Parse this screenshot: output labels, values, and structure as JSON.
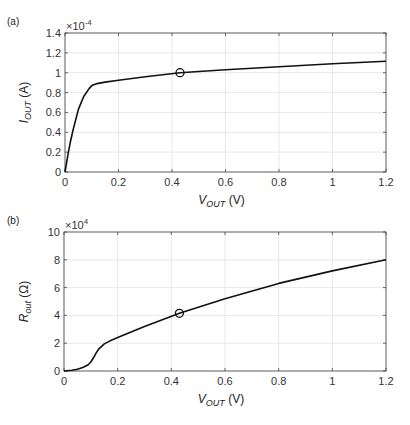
{
  "chart_data": [
    {
      "type": "line",
      "panel_label": "(a)",
      "title": "",
      "xlabel": "V_OUT (V)",
      "xlabel_main": "V",
      "xlabel_sub": "OUT",
      "xlabel_unit": "(V)",
      "ylabel": "I_OUT (A)",
      "ylabel_main": "I",
      "ylabel_sub": "OUT",
      "ylabel_unit": "(A)",
      "exponent_label": "×10",
      "exponent": "-4",
      "xlim": [
        0,
        1.2
      ],
      "ylim": [
        0,
        1.4
      ],
      "x_ticks": [
        "0",
        "0.2",
        "0.4",
        "0.6",
        "0.8",
        "1",
        "1.2"
      ],
      "y_ticks": [
        "0",
        "0.2",
        "0.4",
        "0.6",
        "0.8",
        "1",
        "1.2",
        "1.4"
      ],
      "grid": true,
      "series": [
        {
          "name": "I_OUT",
          "x": [
            0,
            0.01,
            0.02,
            0.03,
            0.05,
            0.07,
            0.09,
            0.1,
            0.12,
            0.15,
            0.2,
            0.3,
            0.43,
            0.6,
            0.8,
            1.0,
            1.2
          ],
          "values": [
            0,
            0.16,
            0.3,
            0.42,
            0.63,
            0.76,
            0.84,
            0.87,
            0.89,
            0.905,
            0.925,
            0.96,
            1.0,
            1.03,
            1.06,
            1.09,
            1.115
          ]
        }
      ],
      "marker": {
        "x": 0.43,
        "y": 1.0,
        "shape": "circle"
      }
    },
    {
      "type": "line",
      "panel_label": "(b)",
      "title": "",
      "xlabel": "V_OUT (V)",
      "xlabel_main": "V",
      "xlabel_sub": "OUT",
      "xlabel_unit": "(V)",
      "ylabel": "R_out (Ω)",
      "ylabel_main": "R",
      "ylabel_sub": "out",
      "ylabel_unit": "(Ω)",
      "exponent_label": "×10",
      "exponent": "4",
      "xlim": [
        0,
        1.2
      ],
      "ylim": [
        0,
        10
      ],
      "x_ticks": [
        "0",
        "0.2",
        "0.4",
        "0.6",
        "0.8",
        "1",
        "1.2"
      ],
      "y_ticks": [
        "0",
        "2",
        "4",
        "6",
        "8",
        "10"
      ],
      "grid": true,
      "series": [
        {
          "name": "R_out",
          "x": [
            0,
            0.03,
            0.05,
            0.07,
            0.09,
            0.1,
            0.11,
            0.12,
            0.13,
            0.15,
            0.17,
            0.2,
            0.3,
            0.43,
            0.6,
            0.8,
            1.0,
            1.2
          ],
          "values": [
            0,
            0.05,
            0.12,
            0.25,
            0.45,
            0.65,
            0.95,
            1.3,
            1.6,
            1.95,
            2.15,
            2.4,
            3.2,
            4.15,
            5.2,
            6.3,
            7.2,
            8.0
          ]
        }
      ],
      "marker": {
        "x": 0.43,
        "y": 4.15,
        "shape": "circle"
      }
    }
  ]
}
